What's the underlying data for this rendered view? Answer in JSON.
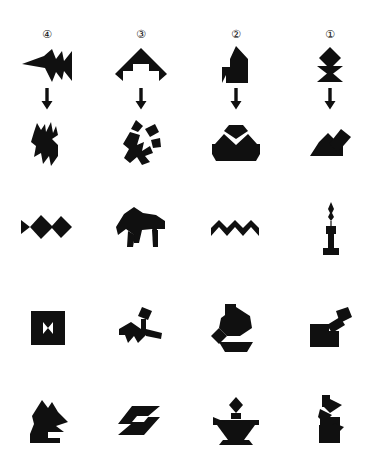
{
  "page": {
    "background_color": "#ffffff",
    "ink_color": "#101010",
    "width": 374,
    "height": 467
  },
  "header": {
    "column_numbers": [
      {
        "label": "④",
        "number": 4,
        "x": 47
      },
      {
        "label": "③",
        "number": 3,
        "x": 141
      },
      {
        "label": "②",
        "number": 2,
        "x": 236
      },
      {
        "label": "①",
        "number": 1,
        "x": 330
      }
    ],
    "arrow_glyph": "down-arrow",
    "arrow_count": 4
  },
  "grid": {
    "columns": 4,
    "rows": 5,
    "column_centers": [
      47,
      141,
      236,
      330
    ],
    "row_centers": [
      65,
      143,
      227,
      327,
      421
    ],
    "arrow_row_y": 99
  },
  "figures": [
    {
      "row": 1,
      "col": 1,
      "name": "jet-arrow-silhouette",
      "cx": 47,
      "cy": 65
    },
    {
      "row": 1,
      "col": 2,
      "name": "mountain-arch-silhouette",
      "cx": 141,
      "cy": 65
    },
    {
      "row": 1,
      "col": 3,
      "name": "house-rocket-silhouette",
      "cx": 236,
      "cy": 65
    },
    {
      "row": 1,
      "col": 4,
      "name": "diamond-hourglass-silhouette",
      "cx": 330,
      "cy": 65
    },
    {
      "row": 2,
      "col": 1,
      "name": "deer-silhouette",
      "cx": 47,
      "cy": 143
    },
    {
      "row": 2,
      "col": 2,
      "name": "running-figure-silhouette",
      "cx": 141,
      "cy": 143
    },
    {
      "row": 2,
      "col": 3,
      "name": "boat-mountain-silhouette",
      "cx": 236,
      "cy": 143
    },
    {
      "row": 2,
      "col": 4,
      "name": "bird-wing-silhouette",
      "cx": 330,
      "cy": 143
    },
    {
      "row": 3,
      "col": 1,
      "name": "fish-silhouette",
      "cx": 47,
      "cy": 227
    },
    {
      "row": 3,
      "col": 2,
      "name": "bear-silhouette",
      "cx": 141,
      "cy": 227
    },
    {
      "row": 3,
      "col": 3,
      "name": "zigzag-wave-silhouette",
      "cx": 236,
      "cy": 227
    },
    {
      "row": 3,
      "col": 4,
      "name": "candle-silhouette",
      "cx": 330,
      "cy": 227
    },
    {
      "row": 4,
      "col": 1,
      "name": "square-bowtie-silhouette",
      "cx": 47,
      "cy": 327
    },
    {
      "row": 4,
      "col": 2,
      "name": "dog-silhouette",
      "cx": 141,
      "cy": 327
    },
    {
      "row": 4,
      "col": 3,
      "name": "chicken-silhouette",
      "cx": 236,
      "cy": 327
    },
    {
      "row": 4,
      "col": 4,
      "name": "chair-silhouette",
      "cx": 330,
      "cy": 327
    },
    {
      "row": 5,
      "col": 1,
      "name": "rooster-silhouette",
      "cx": 47,
      "cy": 421
    },
    {
      "row": 5,
      "col": 2,
      "name": "lightning-bolt-silhouette",
      "cx": 141,
      "cy": 421
    },
    {
      "row": 5,
      "col": 3,
      "name": "oil-lamp-silhouette",
      "cx": 236,
      "cy": 421
    },
    {
      "row": 5,
      "col": 4,
      "name": "rabbit-silhouette",
      "cx": 330,
      "cy": 421
    }
  ]
}
